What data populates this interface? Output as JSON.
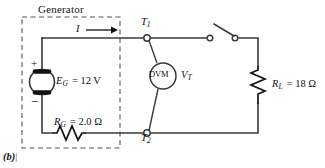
{
  "figure": {
    "caption": "(b)",
    "generator_box_title": "Generator"
  },
  "labels": {
    "source_name": "E",
    "source_sub": "G",
    "source_value": "= 12 V",
    "source_full": "E_G = 12 V",
    "internal_resistor_name": "R",
    "internal_resistor_sub": "G",
    "internal_resistor_value": "= 2.0 Ω",
    "internal_resistor_full": "R_G = 2.0 Ω",
    "load_resistor_name": "R",
    "load_resistor_sub": "L",
    "load_resistor_value": "= 18 Ω",
    "load_resistor_full": "R_L = 18 Ω",
    "current": "I",
    "terminal_1": "T",
    "terminal_1_sub": "1",
    "terminal_2": "T",
    "terminal_2_sub": "2",
    "meter_name": "DVM",
    "meter_voltage": "V",
    "meter_voltage_sub": "T",
    "polarity_plus": "+",
    "polarity_minus": "−"
  },
  "colors": {
    "wire": "#3a3a3a",
    "ink": "#111111",
    "dashed_box": "#555555",
    "background": "#ffffff",
    "node_fill": "#ffffff"
  },
  "circuit": {
    "type": "dc-series-circuit",
    "components": [
      {
        "id": "source",
        "kind": "voltage-source",
        "label": "E_G",
        "value": 12,
        "unit": "V"
      },
      {
        "id": "rg",
        "kind": "resistor",
        "label": "R_G",
        "value": 2.0,
        "unit": "Ω"
      },
      {
        "id": "rl",
        "kind": "resistor",
        "label": "R_L",
        "value": 18,
        "unit": "Ω"
      },
      {
        "id": "dvm",
        "kind": "voltmeter",
        "label": "DVM",
        "measures": "V_T"
      },
      {
        "id": "switch",
        "kind": "switch",
        "state": "open"
      }
    ],
    "terminals": [
      "T1",
      "T2"
    ],
    "current_direction": "left-to-right"
  }
}
